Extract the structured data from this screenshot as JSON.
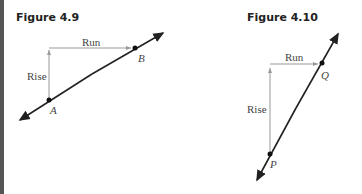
{
  "figures": [
    {
      "title": "Figure 4.9",
      "rise_label": "Rise",
      "run_label": "Run",
      "point_1": "A",
      "point_2": "B"
    },
    {
      "title": "Figure 4.10",
      "rise_label": "Rise",
      "run_label": "Run",
      "point_1": "P",
      "point_2": "Q"
    }
  ]
}
